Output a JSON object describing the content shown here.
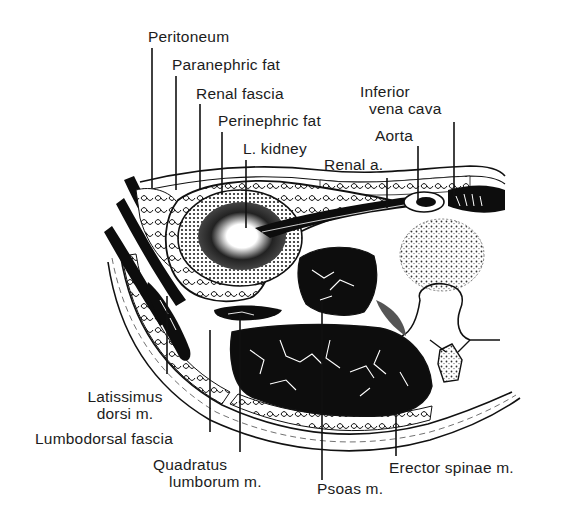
{
  "figure": {
    "type": "anatomical-cross-section"
  },
  "labels": {
    "peritoneum": "Peritoneum",
    "paranephric_fat": "Paranephric fat",
    "renal_fascia": "Renal fascia",
    "perinephric_fat": "Perinephric fat",
    "l_kidney": "L. kidney",
    "renal_a": "Renal a.",
    "inferior_vena_cava_line1": "Inferior",
    "inferior_vena_cava_line2": "vena cava",
    "aorta": "Aorta",
    "latissimus_line1": "Latissimus",
    "latissimus_line2": "dorsi m.",
    "lumbodorsal_fascia": "Lumbodorsal fascia",
    "quadratus_line1": "Quadratus",
    "quadratus_line2": "lumborum m.",
    "psoas": "Psoas m.",
    "erector_spinae": "Erector spinae m."
  },
  "colors": {
    "ink": "#111111",
    "paper": "#ffffff",
    "muscle": "#0d0d0d",
    "stipple": "#555555"
  }
}
